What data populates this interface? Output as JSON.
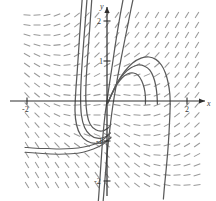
{
  "figure": {
    "title": "",
    "type": "slope-field-with-solution-curves",
    "x_axis_label": "x",
    "y_axis_label": "y",
    "x_tick_labels": [
      "-2",
      "2"
    ],
    "y_tick_labels": [
      "2",
      "1",
      "-1",
      "-2"
    ],
    "tick_x_neg2": "-2",
    "tick_x_pos2": "2",
    "tick_y_pos2": "2",
    "tick_y_pos1": "1",
    "tick_y_neg1": "-1",
    "tick_y_neg2": "-2",
    "colors": {
      "axis": "#2e2e2e",
      "slope_dash": "#9a9a9a",
      "solution_curve": "#5a5a5a",
      "background": "#ffffff"
    }
  },
  "chart_data": {
    "type": "line",
    "title": "",
    "subtitle": "",
    "xlabel": "x",
    "ylabel": "y",
    "xlim": [
      -2.1,
      2.4
    ],
    "ylim": [
      -2.5,
      2.6
    ],
    "xticks": [
      -2,
      2
    ],
    "yticks": [
      2,
      1,
      -1,
      -2
    ],
    "xtick_labels": [
      "-2",
      "2"
    ],
    "ytick_labels": [
      "2",
      "1",
      "-1",
      "-2"
    ],
    "grid": false,
    "legend": null,
    "legend_position": "none",
    "annotations": [],
    "origin_pixel": [
      107,
      101
    ],
    "pixels_per_unit": 40,
    "slope_field": {
      "description": "direction field of short dashes, near-vertical at left and right edges, rotating toward horizontal in the upper-right and lower-left regions, swirling about the origin",
      "x_samples": [
        -2.0,
        -1.75,
        -1.5,
        -1.25,
        -1.0,
        -0.75,
        -0.5,
        -0.25,
        0.0,
        0.25,
        0.5,
        0.75,
        1.0,
        1.25,
        1.5,
        1.75,
        2.0,
        2.25
      ],
      "y_samples": [
        2.4,
        2.15,
        1.9,
        1.65,
        1.4,
        1.15,
        0.9,
        0.65,
        0.4,
        0.15,
        -0.1,
        -0.35,
        -0.6,
        -0.85,
        -1.1,
        -1.35,
        -1.6,
        -1.85,
        -2.1
      ],
      "dash_length_px": 7
    },
    "series": [
      {
        "name": "curve-1-left-descending",
        "comment": "steep curve entering from top, bending left and sweeping down to the lower-left",
        "points": [
          [
            -0.62,
            2.55
          ],
          [
            -0.66,
            2.0
          ],
          [
            -0.7,
            1.4
          ],
          [
            -0.74,
            0.8
          ],
          [
            -0.78,
            0.25
          ],
          [
            -0.8,
            -0.25
          ],
          [
            -0.76,
            -0.6
          ],
          [
            -0.66,
            -0.85
          ],
          [
            -0.5,
            -1.0
          ],
          [
            -0.3,
            -1.06
          ],
          [
            -0.05,
            -1.02
          ],
          [
            0.1,
            -0.92
          ]
        ]
      },
      {
        "name": "curve-2-left-inner",
        "comment": "second left branch nested inside curve 1",
        "points": [
          [
            -0.5,
            2.55
          ],
          [
            -0.55,
            1.9
          ],
          [
            -0.6,
            1.25
          ],
          [
            -0.64,
            0.65
          ],
          [
            -0.66,
            0.1
          ],
          [
            -0.64,
            -0.35
          ],
          [
            -0.56,
            -0.66
          ],
          [
            -0.42,
            -0.85
          ],
          [
            -0.24,
            -0.93
          ],
          [
            -0.05,
            -0.9
          ],
          [
            0.08,
            -0.8
          ]
        ]
      },
      {
        "name": "curve-3-left-innermost",
        "comment": "third left branch, tightest of the left family, joins the origin region",
        "points": [
          [
            -0.38,
            2.55
          ],
          [
            -0.43,
            1.85
          ],
          [
            -0.48,
            1.15
          ],
          [
            -0.52,
            0.55
          ],
          [
            -0.53,
            0.05
          ],
          [
            -0.5,
            -0.32
          ],
          [
            -0.42,
            -0.58
          ],
          [
            -0.28,
            -0.72
          ],
          [
            -0.12,
            -0.75
          ],
          [
            0.02,
            -0.68
          ],
          [
            0.1,
            -0.58
          ]
        ]
      },
      {
        "name": "curve-4-steep-through-origin",
        "comment": "nearly straight steep curve passing through the origin from lower-left to upper-right",
        "points": [
          [
            -0.22,
            -2.55
          ],
          [
            -0.18,
            -2.0
          ],
          [
            -0.14,
            -1.4
          ],
          [
            -0.1,
            -0.85
          ],
          [
            -0.05,
            -0.35
          ],
          [
            0.0,
            0.0
          ],
          [
            0.06,
            0.42
          ],
          [
            0.14,
            0.95
          ],
          [
            0.23,
            1.55
          ],
          [
            0.33,
            2.15
          ],
          [
            0.41,
            2.58
          ]
        ]
      },
      {
        "name": "curve-5-steep-right-of-origin",
        "comment": "second steep near-linear curve, slightly right of curve 4",
        "points": [
          [
            -0.1,
            -2.55
          ],
          [
            -0.05,
            -1.95
          ],
          [
            0.0,
            -1.35
          ],
          [
            0.06,
            -0.8
          ],
          [
            0.12,
            -0.3
          ],
          [
            0.18,
            0.1
          ],
          [
            0.27,
            0.62
          ],
          [
            0.38,
            1.2
          ],
          [
            0.5,
            1.8
          ],
          [
            0.6,
            2.3
          ],
          [
            0.66,
            2.58
          ]
        ]
      },
      {
        "name": "curve-6-right-arc-outer",
        "comment": "outermost right arc: rises from origin, turns over near y=1.1 and descends to the x-axis near x=1.6",
        "points": [
          [
            0.02,
            -0.05
          ],
          [
            0.14,
            0.22
          ],
          [
            0.28,
            0.5
          ],
          [
            0.45,
            0.75
          ],
          [
            0.64,
            0.95
          ],
          [
            0.85,
            1.07
          ],
          [
            1.05,
            1.1
          ],
          [
            1.22,
            1.04
          ],
          [
            1.36,
            0.9
          ],
          [
            1.46,
            0.7
          ],
          [
            1.53,
            0.45
          ],
          [
            1.57,
            0.18
          ],
          [
            1.58,
            -0.08
          ]
        ]
      },
      {
        "name": "curve-7-right-arc-middle",
        "comment": "middle right arc, nested inside the outer arc",
        "points": [
          [
            0.02,
            -0.05
          ],
          [
            0.13,
            0.2
          ],
          [
            0.26,
            0.46
          ],
          [
            0.42,
            0.68
          ],
          [
            0.6,
            0.83
          ],
          [
            0.78,
            0.9
          ],
          [
            0.94,
            0.87
          ],
          [
            1.07,
            0.77
          ],
          [
            1.16,
            0.6
          ],
          [
            1.22,
            0.38
          ],
          [
            1.25,
            0.14
          ],
          [
            1.26,
            -0.08
          ]
        ]
      },
      {
        "name": "curve-8-right-arc-inner",
        "comment": "innermost right arc, smallest of the right family",
        "points": [
          [
            0.02,
            -0.05
          ],
          [
            0.12,
            0.17
          ],
          [
            0.24,
            0.4
          ],
          [
            0.38,
            0.58
          ],
          [
            0.52,
            0.68
          ],
          [
            0.66,
            0.7
          ],
          [
            0.78,
            0.64
          ],
          [
            0.87,
            0.5
          ],
          [
            0.93,
            0.32
          ],
          [
            0.96,
            0.12
          ],
          [
            0.96,
            -0.08
          ]
        ]
      },
      {
        "name": "curve-9-lower-left-sweep",
        "comment": "long low sweep through the lower-left, flattening toward the bottom-left corner",
        "points": [
          [
            0.1,
            -0.9
          ],
          [
            -0.1,
            -1.08
          ],
          [
            -0.34,
            -1.2
          ],
          [
            -0.6,
            -1.28
          ],
          [
            -0.9,
            -1.32
          ],
          [
            -1.2,
            -1.33
          ],
          [
            -1.5,
            -1.32
          ],
          [
            -1.8,
            -1.3
          ],
          [
            -2.05,
            -1.28
          ]
        ]
      },
      {
        "name": "curve-10-lower-left-sweep-2",
        "comment": "second low sweep just above curve 9",
        "points": [
          [
            0.08,
            -0.8
          ],
          [
            -0.1,
            -0.97
          ],
          [
            -0.32,
            -1.08
          ],
          [
            -0.58,
            -1.15
          ],
          [
            -0.88,
            -1.19
          ],
          [
            -1.18,
            -1.2
          ],
          [
            -1.48,
            -1.19
          ],
          [
            -1.78,
            -1.18
          ],
          [
            -2.05,
            -1.16
          ]
        ]
      },
      {
        "name": "curve-11-right-descender",
        "comment": "short steep descender at the right edge below the x-axis",
        "points": [
          [
            1.58,
            -0.08
          ],
          [
            1.57,
            -0.4
          ],
          [
            1.55,
            -0.8
          ],
          [
            1.52,
            -1.25
          ],
          [
            1.48,
            -1.7
          ],
          [
            1.44,
            -2.1
          ],
          [
            1.41,
            -2.45
          ]
        ]
      }
    ]
  }
}
